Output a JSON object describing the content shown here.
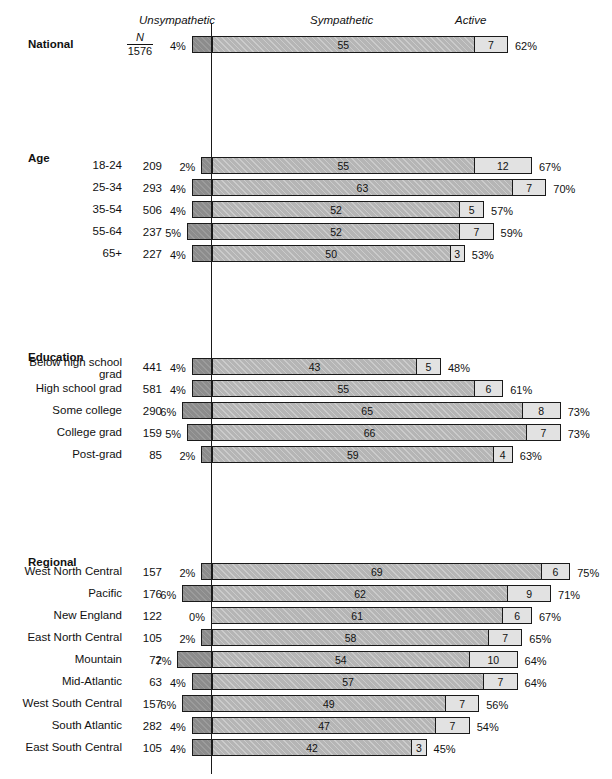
{
  "headers": {
    "unsympathetic": "Unsympathetic",
    "sympathetic": "Sympathetic",
    "active": "Active"
  },
  "national_n": {
    "symbol": "N",
    "value": "1576"
  },
  "groups": [
    {
      "title": "",
      "rows_key": "national"
    },
    {
      "title": "Age",
      "rows_key": "age"
    },
    {
      "title": "Education",
      "rows_key": "education"
    },
    {
      "title": "Regional",
      "rows_key": "regional"
    }
  ],
  "chart_data": {
    "type": "bar",
    "subtype": "diverging-stacked-bar",
    "title": "",
    "xlabel": "",
    "ylabel": "",
    "grid": false,
    "legend_position": "top",
    "axis_zero_label": "0",
    "segments": [
      "Unsympathetic",
      "Sympathetic",
      "Active"
    ],
    "segment_colors": [
      "#8c8c8c",
      "#b5b5b5",
      "#e2e2e2"
    ],
    "note": "Unsympathetic extends left of the zero line; Sympathetic + Active extend right. Total % label = Sympathetic + Active.",
    "sections": [
      {
        "name": "National",
        "bold": true,
        "rows": [
          {
            "label": "National",
            "n": "1576",
            "unsym": 4,
            "unsym_label": "4%",
            "sym": 55,
            "sym_label": "55",
            "act": 7,
            "act_label": "7",
            "total_label": "62%"
          }
        ]
      },
      {
        "name": "Age",
        "rows": [
          {
            "label": "18-24",
            "n": "209",
            "unsym": 2,
            "unsym_label": "2%",
            "sym": 55,
            "sym_label": "55",
            "act": 12,
            "act_label": "12",
            "total_label": "67%"
          },
          {
            "label": "25-34",
            "n": "293",
            "unsym": 4,
            "unsym_label": "4%",
            "sym": 63,
            "sym_label": "63",
            "act": 7,
            "act_label": "7",
            "total_label": "70%"
          },
          {
            "label": "35-54",
            "n": "506",
            "unsym": 4,
            "unsym_label": "4%",
            "sym": 52,
            "sym_label": "52",
            "act": 5,
            "act_label": "5",
            "total_label": "57%"
          },
          {
            "label": "55-64",
            "n": "237",
            "unsym": 5,
            "unsym_label": "5%",
            "sym": 52,
            "sym_label": "52",
            "act": 7,
            "act_label": "7",
            "total_label": "59%"
          },
          {
            "label": "65+",
            "n": "227",
            "unsym": 4,
            "unsym_label": "4%",
            "sym": 50,
            "sym_label": "50",
            "act": 3,
            "act_label": "3",
            "total_label": "53%"
          }
        ]
      },
      {
        "name": "Education",
        "rows": [
          {
            "label": "Below high school\ngrad",
            "n": "441",
            "unsym": 4,
            "unsym_label": "4%",
            "sym": 43,
            "sym_label": "43",
            "act": 5,
            "act_label": "5",
            "total_label": "48%"
          },
          {
            "label": "High school grad",
            "n": "581",
            "unsym": 4,
            "unsym_label": "4%",
            "sym": 55,
            "sym_label": "55",
            "act": 6,
            "act_label": "6",
            "total_label": "61%"
          },
          {
            "label": "Some college",
            "n": "290",
            "unsym": 6,
            "unsym_label": "6%",
            "sym": 65,
            "sym_label": "65",
            "act": 8,
            "act_label": "8",
            "total_label": "73%"
          },
          {
            "label": "College grad",
            "n": "159",
            "unsym": 5,
            "unsym_label": "5%",
            "sym": 66,
            "sym_label": "66",
            "act": 7,
            "act_label": "7",
            "total_label": "73%"
          },
          {
            "label": "Post-grad",
            "n": "85",
            "unsym": 2,
            "unsym_label": "2%",
            "sym": 59,
            "sym_label": "59",
            "act": 4,
            "act_label": "4",
            "total_label": "63%"
          }
        ]
      },
      {
        "name": "Regional",
        "rows": [
          {
            "label": "West North Central",
            "n": "157",
            "unsym": 2,
            "unsym_label": "2%",
            "sym": 69,
            "sym_label": "69",
            "act": 6,
            "act_label": "6",
            "total_label": "75%"
          },
          {
            "label": "Pacific",
            "n": "176",
            "unsym": 6,
            "unsym_label": "6%",
            "sym": 62,
            "sym_label": "62",
            "act": 9,
            "act_label": "9",
            "total_label": "71%"
          },
          {
            "label": "New England",
            "n": "122",
            "unsym": 0,
            "unsym_label": "0%",
            "sym": 61,
            "sym_label": "61",
            "act": 6,
            "act_label": "6",
            "total_label": "67%"
          },
          {
            "label": "East North Central",
            "n": "105",
            "unsym": 2,
            "unsym_label": "2%",
            "sym": 58,
            "sym_label": "58",
            "act": 7,
            "act_label": "7",
            "total_label": "65%"
          },
          {
            "label": "Mountain",
            "n": "72",
            "unsym": 7,
            "unsym_label": "7%",
            "sym": 54,
            "sym_label": "54",
            "act": 10,
            "act_label": "10",
            "total_label": "64%"
          },
          {
            "label": "Mid-Atlantic",
            "n": "63",
            "unsym": 4,
            "unsym_label": "4%",
            "sym": 57,
            "sym_label": "57",
            "act": 7,
            "act_label": "7",
            "total_label": "64%"
          },
          {
            "label": "West South Central",
            "n": "157",
            "unsym": 6,
            "unsym_label": "6%",
            "sym": 49,
            "sym_label": "49",
            "act": 7,
            "act_label": "7",
            "total_label": "56%"
          },
          {
            "label": "South Atlantic",
            "n": "282",
            "unsym": 4,
            "unsym_label": "4%",
            "sym": 47,
            "sym_label": "47",
            "act": 7,
            "act_label": "7",
            "total_label": "54%"
          },
          {
            "label": "East South Central",
            "n": "105",
            "unsym": 4,
            "unsym_label": "4%",
            "sym": 42,
            "sym_label": "42",
            "act": 3,
            "act_label": "3",
            "total_label": "45%"
          }
        ]
      }
    ]
  },
  "layout": {
    "zero_x": 211,
    "px_per_pct": 4.79,
    "section_tops": [
      36,
      157,
      358,
      563
    ],
    "row_pitch": 22,
    "group_title_tops": [
      0,
      152,
      351,
      556
    ]
  }
}
